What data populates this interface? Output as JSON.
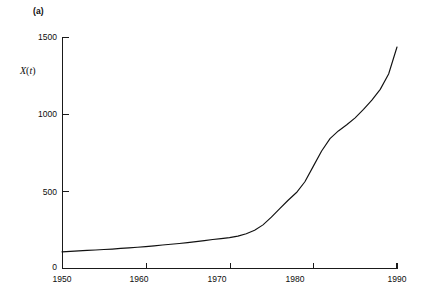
{
  "figure": {
    "panel_label": "(a)",
    "ylabel_var": "X",
    "ylabel_paren_open": "(",
    "ylabel_arg": "t",
    "ylabel_paren_close": ")",
    "line_color": "#111111",
    "axis_color": "#1a1a1a",
    "background": "#ffffff"
  },
  "chart_data": {
    "type": "line",
    "title": "(a)",
    "xlabel": "",
    "ylabel": "X(t)",
    "xlim": [
      1950,
      1990
    ],
    "ylim": [
      0,
      1500
    ],
    "grid": false,
    "legend": null,
    "xticks": [
      1950,
      1960,
      1970,
      1980,
      1990
    ],
    "xtick_labels": [
      "1950",
      "1960",
      "1970",
      "1980",
      "1990"
    ],
    "yticks": [
      0,
      500,
      1000,
      1500
    ],
    "ytick_labels": [
      "0",
      "500",
      "1000",
      "1500"
    ],
    "series": [
      {
        "name": "X(t)",
        "x": [
          1950,
          1951,
          1952,
          1953,
          1954,
          1955,
          1956,
          1957,
          1958,
          1959,
          1960,
          1961,
          1962,
          1963,
          1964,
          1965,
          1966,
          1967,
          1968,
          1969,
          1970,
          1971,
          1972,
          1973,
          1974,
          1975,
          1976,
          1977,
          1978,
          1979,
          1980,
          1981,
          1982,
          1983,
          1984,
          1985,
          1986,
          1987,
          1988,
          1989,
          1990
        ],
        "values": [
          105,
          108,
          111,
          114,
          117,
          120,
          123,
          127,
          131,
          135,
          139,
          144,
          149,
          154,
          159,
          165,
          171,
          178,
          185,
          191,
          197,
          207,
          222,
          245,
          280,
          330,
          385,
          440,
          490,
          560,
          660,
          760,
          840,
          890,
          930,
          975,
          1030,
          1090,
          1160,
          1260,
          1435
        ]
      }
    ]
  },
  "ytick_positions": [
    {
      "label": "1500",
      "top": 32
    },
    {
      "label": "1000",
      "top": 109
    },
    {
      "label": "500",
      "top": 187
    },
    {
      "label": "0",
      "top": 262
    }
  ],
  "xtick_positions": [
    {
      "label": "1950",
      "left": 62
    },
    {
      "label": "1960",
      "left": 139
    },
    {
      "label": "1970",
      "left": 217
    },
    {
      "label": "1980",
      "left": 295
    },
    {
      "label": "1990",
      "left": 397
    }
  ]
}
